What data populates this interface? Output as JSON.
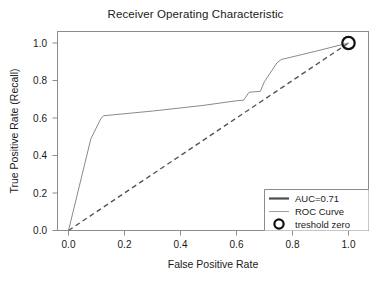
{
  "chart_data": {
    "type": "line",
    "title": "Receiver Operating Characteristic",
    "xlabel": "False Positive Rate",
    "ylabel": "True Positive Rate (Recall)",
    "xlim": [
      -0.04,
      1.04
    ],
    "ylim": [
      -0.04,
      1.05
    ],
    "xticks": [
      0.0,
      0.2,
      0.4,
      0.6,
      0.8,
      1.0
    ],
    "yticks": [
      0.0,
      0.2,
      0.4,
      0.6,
      0.8,
      1.0
    ],
    "xticklabels": [
      "0.0",
      "0.2",
      "0.4",
      "0.6",
      "0.8",
      "1.0"
    ],
    "yticklabels": [
      "0.0",
      "0.2",
      "0.4",
      "0.6",
      "0.8",
      "1.0"
    ],
    "grid": false,
    "legend_position": "lower right",
    "series": [
      {
        "name": "ROC Curve",
        "style": "solid",
        "color": "#8a8a8a",
        "linewidth": 1.0,
        "x": [
          0.0,
          0.08,
          0.115,
          0.125,
          0.3,
          0.48,
          0.6,
          0.625,
          0.645,
          0.665,
          0.685,
          0.7,
          0.745,
          0.76,
          0.88,
          1.0
        ],
        "y": [
          0.0,
          0.49,
          0.595,
          0.612,
          0.637,
          0.667,
          0.692,
          0.695,
          0.737,
          0.74,
          0.742,
          0.795,
          0.895,
          0.912,
          0.955,
          1.0
        ]
      },
      {
        "name": "Chance diagonal",
        "style": "dashed",
        "color": "#555555",
        "linewidth": 1.4,
        "x": [
          0.0,
          1.0
        ],
        "y": [
          0.0,
          1.0
        ]
      }
    ],
    "markers": [
      {
        "name": "treshold zero",
        "x": 1.0,
        "y": 1.0,
        "shape": "circle",
        "color": "#111111",
        "size": 9
      }
    ],
    "annotations": []
  },
  "legend": {
    "entries": [
      {
        "label": "AUC=0.71",
        "type": "line",
        "color": "#4d4d4d",
        "linewidth": 2.2
      },
      {
        "label": "ROC Curve",
        "type": "line",
        "color": "#a0a0a0",
        "linewidth": 1.0
      },
      {
        "label": "treshold zero",
        "type": "marker",
        "color": "#111111",
        "shape": "circle"
      }
    ]
  },
  "colors": {
    "axis": "#8c8c8c",
    "text": "#1a1a1a",
    "roc_curve": "#8a8a8a",
    "diagonal": "#555555",
    "auc_legend_line": "#4d4d4d",
    "marker": "#111111",
    "background": "#ffffff"
  }
}
